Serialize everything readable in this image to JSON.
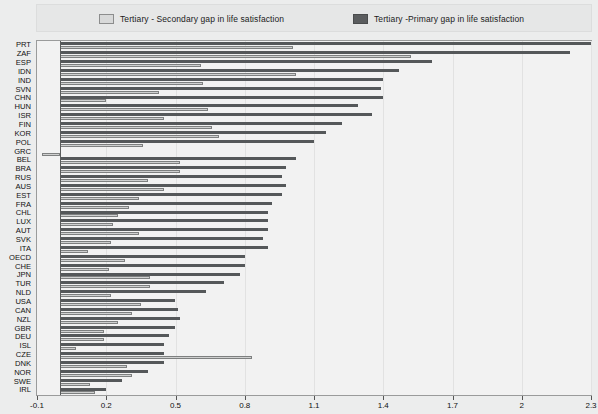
{
  "legend": {
    "entries": [
      {
        "label": "Tertiary - Secondary gap in life satisfaction",
        "swatch": "light-gray-square",
        "color": "#d8d9d9"
      },
      {
        "label": "Tertiary -Primary gap in life satisfaction",
        "swatch": "dark-gray-square",
        "color": "#5b5d5f"
      }
    ]
  },
  "axis": {
    "x_ticks": [
      "-0.1",
      "0.2",
      "0.5",
      "0.8",
      "1.1",
      "1.4",
      "1.7",
      "2",
      "2.3"
    ],
    "x_min": -0.1,
    "x_max": 2.3,
    "x_step": 0.3
  },
  "chart_data": {
    "type": "bar",
    "orientation": "horizontal",
    "title": "",
    "xlabel": "",
    "ylabel": "",
    "xlim": [
      -0.1,
      2.3
    ],
    "grid": true,
    "legend_position": "top",
    "categories": [
      "PRT",
      "ZAF",
      "ESP",
      "IDN",
      "IND",
      "SVN",
      "CHN",
      "HUN",
      "ISR",
      "FIN",
      "KOR",
      "POL",
      "GRC",
      "BEL",
      "BRA",
      "RUS",
      "AUS",
      "EST",
      "FRA",
      "CHL",
      "LUX",
      "AUT",
      "SVK",
      "ITA",
      "OECD",
      "CHE",
      "JPN",
      "TUR",
      "NLD",
      "USA",
      "CAN",
      "NZL",
      "GBR",
      "DEU",
      "ISL",
      "CZE",
      "DNK",
      "NOR",
      "SWE",
      "IRL"
    ],
    "series": [
      {
        "name": "Tertiary -Primary gap in life satisfaction",
        "color": "#55585a",
        "values": [
          2.3,
          2.21,
          1.61,
          1.47,
          1.4,
          1.39,
          1.4,
          1.29,
          1.35,
          1.22,
          1.15,
          1.1,
          0.0,
          1.02,
          0.98,
          0.96,
          0.98,
          0.96,
          0.92,
          0.9,
          0.9,
          0.9,
          0.88,
          0.9,
          0.8,
          0.8,
          0.78,
          0.71,
          0.63,
          0.5,
          0.51,
          0.52,
          0.5,
          0.47,
          0.45,
          0.45,
          0.45,
          0.38,
          0.27,
          0.2
        ]
      },
      {
        "name": "Tertiary - Secondary gap in life satisfaction",
        "color": "#cfd0d0",
        "values": [
          1.01,
          1.52,
          0.61,
          1.02,
          0.62,
          0.43,
          0.2,
          0.64,
          0.45,
          0.66,
          0.69,
          0.36,
          -0.08,
          0.52,
          0.52,
          0.38,
          0.45,
          0.34,
          0.3,
          0.25,
          0.23,
          0.34,
          0.22,
          0.12,
          0.28,
          0.21,
          0.39,
          0.39,
          0.22,
          0.35,
          0.31,
          0.25,
          0.19,
          0.19,
          0.07,
          0.83,
          0.29,
          0.31,
          0.13,
          0.15
        ]
      }
    ]
  }
}
